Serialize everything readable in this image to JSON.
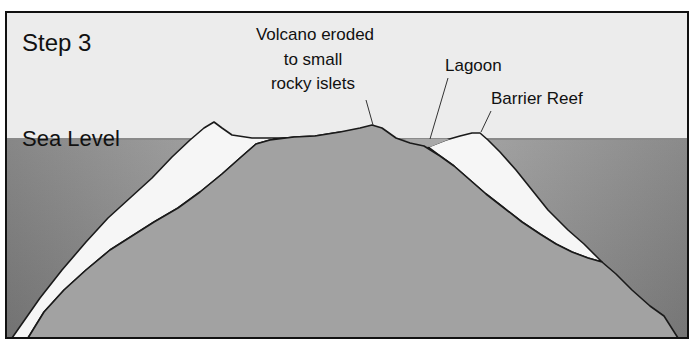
{
  "diagram": {
    "title": "Step 3",
    "labels": {
      "sea_level": "Sea Level",
      "volcano_line1": "Volcano eroded",
      "volcano_line2": "to small",
      "volcano_line3": "rocky islets",
      "lagoon": "Lagoon",
      "barrier_reef": "Barrier Reef"
    },
    "colors": {
      "sky": "#ececec",
      "sea": "#9a9a9a",
      "sea_dark": "#7e7e7e",
      "volcano": "#a3a3a3",
      "reef": "#f7f7f7",
      "sea_line": "#8f8f8f",
      "outline": "#1a1a1a"
    }
  }
}
